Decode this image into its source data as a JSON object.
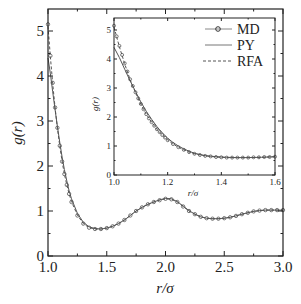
{
  "chart_data": [
    {
      "id": "main",
      "type": "line",
      "title": "",
      "xlabel": "r/σ",
      "ylabel": "g(r)",
      "xlim": [
        1.0,
        3.0
      ],
      "ylim": [
        0,
        5.5
      ],
      "xticks": [
        1.0,
        1.5,
        2.0,
        2.5,
        3.0
      ],
      "xtick_labels": [
        "1.0",
        "1.5",
        "2.0",
        "2.5",
        "3.0"
      ],
      "yticks": [
        0,
        1,
        2,
        3,
        4,
        5
      ],
      "ytick_labels": [
        "0",
        "1",
        "2",
        "3",
        "4",
        "5"
      ],
      "grid": false,
      "series": [
        {
          "name": "MD",
          "style": "circles",
          "x": [
            1.0,
            1.02,
            1.04,
            1.06,
            1.08,
            1.1,
            1.12,
            1.14,
            1.16,
            1.18,
            1.2,
            1.25,
            1.3,
            1.35,
            1.4,
            1.45,
            1.5,
            1.55,
            1.6,
            1.65,
            1.7,
            1.75,
            1.8,
            1.85,
            1.9,
            1.95,
            2.0,
            2.05,
            2.1,
            2.15,
            2.2,
            2.25,
            2.3,
            2.35,
            2.4,
            2.45,
            2.5,
            2.55,
            2.6,
            2.65,
            2.7,
            2.75,
            2.8,
            2.85,
            2.9,
            2.95,
            3.0
          ],
          "values": [
            5.15,
            4.45,
            3.85,
            3.3,
            2.85,
            2.45,
            2.1,
            1.82,
            1.58,
            1.38,
            1.2,
            0.9,
            0.72,
            0.63,
            0.6,
            0.6,
            0.62,
            0.66,
            0.72,
            0.8,
            0.9,
            1.0,
            1.08,
            1.15,
            1.2,
            1.24,
            1.27,
            1.26,
            1.2,
            1.1,
            1.0,
            0.93,
            0.87,
            0.84,
            0.83,
            0.83,
            0.84,
            0.86,
            0.89,
            0.93,
            0.96,
            0.99,
            1.01,
            1.02,
            1.02,
            1.02,
            1.02
          ]
        },
        {
          "name": "PY",
          "style": "solid",
          "x": [
            1.0,
            1.02,
            1.04,
            1.06,
            1.08,
            1.1,
            1.12,
            1.14,
            1.16,
            1.18,
            1.2,
            1.25,
            1.3,
            1.35,
            1.4,
            1.45,
            1.5,
            1.55,
            1.6,
            1.65,
            1.7,
            1.75,
            1.8,
            1.85,
            1.9,
            1.95,
            2.0,
            2.05,
            2.1,
            2.15,
            2.2,
            2.25,
            2.3,
            2.35,
            2.4,
            2.45,
            2.5,
            2.55,
            2.6,
            2.65,
            2.7,
            2.75,
            2.8,
            2.85,
            2.9,
            2.95,
            3.0
          ],
          "values": [
            4.4,
            4.05,
            3.65,
            3.25,
            2.88,
            2.52,
            2.2,
            1.92,
            1.67,
            1.45,
            1.27,
            0.95,
            0.75,
            0.65,
            0.61,
            0.6,
            0.62,
            0.66,
            0.72,
            0.8,
            0.9,
            1.0,
            1.08,
            1.15,
            1.2,
            1.25,
            1.28,
            1.27,
            1.21,
            1.11,
            1.01,
            0.93,
            0.87,
            0.84,
            0.83,
            0.83,
            0.84,
            0.86,
            0.89,
            0.93,
            0.96,
            0.99,
            1.01,
            1.02,
            1.02,
            1.02,
            1.02
          ]
        },
        {
          "name": "RFA",
          "style": "dashed",
          "x": [
            1.0,
            1.02,
            1.04,
            1.06,
            1.08,
            1.1,
            1.12,
            1.14,
            1.16,
            1.18,
            1.2,
            1.25,
            1.3,
            1.35,
            1.4,
            1.45,
            1.5,
            1.55,
            1.6,
            1.65,
            1.7,
            1.75,
            1.8,
            1.85,
            1.9,
            1.95,
            2.0,
            2.05,
            2.1,
            2.15,
            2.2,
            2.25,
            2.3,
            2.35,
            2.4,
            2.45,
            2.5,
            2.55,
            2.6,
            2.65,
            2.7,
            2.75,
            2.8,
            2.85,
            2.9,
            2.95,
            3.0
          ],
          "values": [
            5.1,
            4.42,
            3.83,
            3.29,
            2.84,
            2.44,
            2.1,
            1.82,
            1.58,
            1.38,
            1.21,
            0.91,
            0.72,
            0.63,
            0.6,
            0.6,
            0.62,
            0.66,
            0.72,
            0.8,
            0.9,
            1.0,
            1.08,
            1.15,
            1.2,
            1.24,
            1.27,
            1.26,
            1.2,
            1.1,
            1.0,
            0.93,
            0.87,
            0.84,
            0.83,
            0.83,
            0.84,
            0.86,
            0.89,
            0.93,
            0.96,
            0.99,
            1.01,
            1.02,
            1.02,
            1.02,
            1.02
          ]
        }
      ],
      "legend": {
        "position": "upper right (inside inset)",
        "entries": [
          "MD",
          "PY",
          "RFA"
        ]
      }
    },
    {
      "id": "inset",
      "type": "line",
      "title": "",
      "xlabel": "r/σ",
      "ylabel": "g(r)",
      "xlim": [
        1.0,
        1.6
      ],
      "ylim": [
        0,
        5.4
      ],
      "xticks": [
        1.0,
        1.2,
        1.4,
        1.6
      ],
      "xtick_labels": [
        "1.0",
        "1.2",
        "1.4",
        "1.6"
      ],
      "yticks": [
        0,
        1,
        2,
        3,
        4,
        5
      ],
      "ytick_labels": [
        "0",
        "1",
        "2",
        "3",
        "4",
        "5"
      ],
      "grid": false,
      "series": [
        {
          "name": "MD",
          "style": "circles",
          "x": [
            1.0,
            1.01,
            1.02,
            1.03,
            1.04,
            1.05,
            1.06,
            1.07,
            1.08,
            1.09,
            1.1,
            1.11,
            1.12,
            1.13,
            1.14,
            1.15,
            1.16,
            1.17,
            1.18,
            1.19,
            1.2,
            1.22,
            1.24,
            1.26,
            1.28,
            1.3,
            1.32,
            1.34,
            1.36,
            1.38,
            1.4,
            1.42,
            1.44,
            1.46,
            1.48,
            1.5,
            1.52,
            1.54,
            1.56,
            1.58,
            1.6
          ],
          "values": [
            5.15,
            4.78,
            4.45,
            4.14,
            3.85,
            3.57,
            3.3,
            3.07,
            2.85,
            2.64,
            2.45,
            2.27,
            2.1,
            1.95,
            1.82,
            1.7,
            1.58,
            1.48,
            1.38,
            1.29,
            1.2,
            1.07,
            0.96,
            0.87,
            0.79,
            0.73,
            0.69,
            0.66,
            0.64,
            0.62,
            0.61,
            0.6,
            0.6,
            0.6,
            0.6,
            0.6,
            0.61,
            0.61,
            0.62,
            0.62,
            0.63
          ]
        },
        {
          "name": "PY",
          "style": "solid",
          "x": [
            1.0,
            1.02,
            1.04,
            1.06,
            1.08,
            1.1,
            1.12,
            1.14,
            1.16,
            1.18,
            1.2,
            1.22,
            1.24,
            1.26,
            1.28,
            1.3,
            1.34,
            1.38,
            1.42,
            1.46,
            1.5,
            1.55,
            1.6
          ],
          "values": [
            4.4,
            4.05,
            3.65,
            3.25,
            2.88,
            2.52,
            2.2,
            1.92,
            1.67,
            1.45,
            1.27,
            1.12,
            1.0,
            0.9,
            0.82,
            0.75,
            0.67,
            0.63,
            0.61,
            0.6,
            0.6,
            0.61,
            0.63
          ]
        },
        {
          "name": "RFA",
          "style": "dashed",
          "x": [
            1.0,
            1.02,
            1.04,
            1.06,
            1.08,
            1.1,
            1.12,
            1.14,
            1.16,
            1.18,
            1.2,
            1.22,
            1.24,
            1.26,
            1.28,
            1.3,
            1.34,
            1.38,
            1.42,
            1.46,
            1.5,
            1.55,
            1.6
          ],
          "values": [
            5.1,
            4.42,
            3.83,
            3.29,
            2.84,
            2.44,
            2.1,
            1.82,
            1.58,
            1.38,
            1.21,
            1.07,
            0.96,
            0.87,
            0.79,
            0.73,
            0.66,
            0.62,
            0.6,
            0.6,
            0.6,
            0.61,
            0.63
          ]
        }
      ]
    }
  ],
  "colors": {
    "axis": "#222222",
    "line": "#555555",
    "marker": "#555555",
    "background": "#ffffff"
  }
}
